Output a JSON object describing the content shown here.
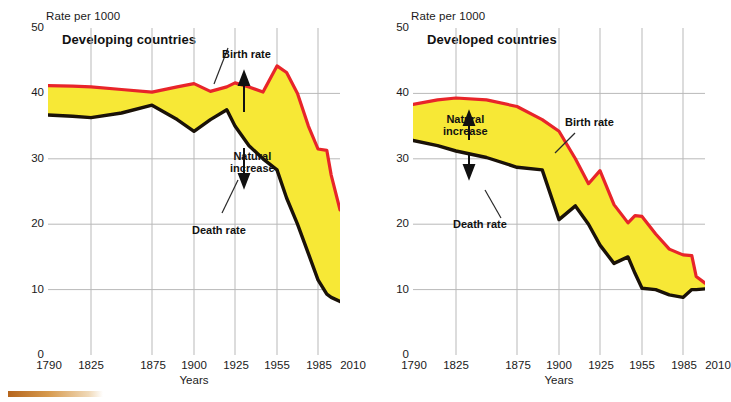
{
  "figure": {
    "bottom_bar_color": "#b5651d"
  },
  "colors": {
    "birth_rate": "#e8252a",
    "death_rate": "#1a1208",
    "natural_increase_fill": "#f7e836",
    "grid": "#b9b9b9",
    "axis": "#6e6e6e"
  },
  "panels": [
    {
      "id": "developing",
      "title": "Developing countries",
      "y_axis_title": "Rate per 1000",
      "x_axis_title": "Years",
      "annotations": [
        {
          "name": "birth-rate-label",
          "text": "Birth rate"
        },
        {
          "name": "death-rate-label",
          "text": "Death rate"
        },
        {
          "name": "natural-increase-label",
          "text": "Natural\nincrease"
        }
      ]
    },
    {
      "id": "developed",
      "title": "Developed countries",
      "y_axis_title": "Rate per 1000",
      "x_axis_title": "Years",
      "annotations": [
        {
          "name": "birth-rate-label",
          "text": "Birth rate"
        },
        {
          "name": "death-rate-label",
          "text": "Death rate"
        },
        {
          "name": "natural-increase-label",
          "text": "Natural\nincrease"
        }
      ]
    }
  ],
  "chart_data": [
    {
      "type": "area",
      "title": "Developing countries",
      "xlabel": "Years",
      "ylabel": "Rate per 1000",
      "ylim": [
        0,
        50
      ],
      "yticks": [
        0,
        10,
        20,
        30,
        40,
        50
      ],
      "xticks": [
        1790,
        1825,
        1875,
        1900,
        1925,
        1955,
        1985,
        2010
      ],
      "xtick_labels": [
        "1790",
        "1825",
        "1875",
        "1900",
        "1925",
        "1955",
        "1985",
        "2010"
      ],
      "grid": true,
      "legend": "annotated",
      "fill_between": {
        "label": "Natural increase",
        "upper": "Birth rate",
        "lower": "Death rate",
        "color": "#f7e836"
      },
      "x": [
        1790,
        1810,
        1825,
        1850,
        1875,
        1890,
        1900,
        1910,
        1920,
        1925,
        1935,
        1945,
        1955,
        1962,
        1970,
        1978,
        1985,
        1995,
        2000,
        2010
      ],
      "series": [
        {
          "name": "Birth rate",
          "color": "#e8252a",
          "values": [
            41.2,
            41.1,
            41.0,
            40.6,
            40.2,
            41.0,
            41.5,
            40.3,
            41.0,
            41.6,
            41.0,
            40.2,
            44.2,
            43.2,
            40.0,
            35.0,
            31.5,
            31.3,
            27.5,
            22.2
          ]
        },
        {
          "name": "Death rate",
          "color": "#1a1208",
          "values": [
            36.7,
            36.5,
            36.3,
            37.0,
            38.2,
            36.0,
            34.2,
            36.0,
            37.5,
            35.0,
            32.0,
            30.0,
            28.3,
            24.0,
            20.0,
            15.5,
            11.5,
            9.3,
            8.8,
            8.2
          ]
        }
      ]
    },
    {
      "type": "area",
      "title": "Developed countries",
      "xlabel": "Years",
      "ylabel": "Rate per 1000",
      "ylim": [
        0,
        50
      ],
      "yticks": [
        0,
        10,
        20,
        30,
        40,
        50
      ],
      "xticks": [
        1790,
        1825,
        1875,
        1900,
        1925,
        1955,
        1985,
        2010
      ],
      "xtick_labels": [
        "1790",
        "1825",
        "1875",
        "1900",
        "1925",
        "1955",
        "1985",
        "2010"
      ],
      "grid": true,
      "legend": "annotated",
      "fill_between": {
        "label": "Natural increase",
        "upper": "Birth rate",
        "lower": "Death rate",
        "color": "#f7e836"
      },
      "x": [
        1790,
        1810,
        1825,
        1850,
        1875,
        1890,
        1900,
        1910,
        1918,
        1925,
        1935,
        1945,
        1950,
        1955,
        1965,
        1975,
        1985,
        1995,
        2000,
        2010
      ],
      "series": [
        {
          "name": "Birth rate",
          "color": "#e8252a",
          "values": [
            38.3,
            39.0,
            39.3,
            39.0,
            38.0,
            36.0,
            34.2,
            30.0,
            26.2,
            28.2,
            23.0,
            20.2,
            21.3,
            21.2,
            18.5,
            16.2,
            15.3,
            15.2,
            12.0,
            11.0
          ]
        },
        {
          "name": "Death rate",
          "color": "#1a1208",
          "values": [
            32.8,
            32.0,
            31.2,
            30.2,
            28.7,
            28.3,
            20.7,
            22.8,
            20.0,
            16.8,
            14.0,
            15.0,
            12.5,
            10.2,
            10.0,
            9.2,
            8.8,
            10.0,
            10.0,
            10.1
          ]
        }
      ]
    }
  ]
}
